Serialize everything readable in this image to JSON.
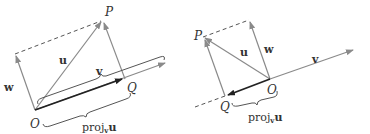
{
  "colors": {
    "vector": "#8a8a8a",
    "projection": "#2a2a2a",
    "dashed": "#555555",
    "text": "#333333"
  },
  "left": {
    "labels": {
      "P": "P",
      "Q": "Q",
      "O": "O",
      "u": "u",
      "v": "v",
      "w": "w",
      "proj": "proj",
      "proj_sub": "v",
      "proj_vec": "u"
    }
  },
  "right": {
    "labels": {
      "P": "P",
      "Q": "Q",
      "O": "O",
      "u": "u",
      "v": "v",
      "w": "w",
      "proj": "proj",
      "proj_sub": "v",
      "proj_vec": "u"
    }
  }
}
